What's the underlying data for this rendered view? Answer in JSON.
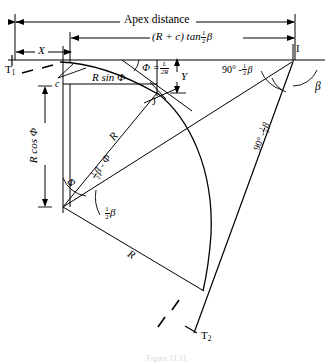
{
  "figure": {
    "caption": "Figure 11.11",
    "line_color": "#000000",
    "background": "#ffffff"
  },
  "dimensions": {
    "apex_distance": "Apex distance",
    "r_plus_c_tan": "(R + c) tan",
    "half_beta": "½ β",
    "x": "X",
    "y": "Y",
    "c": "c",
    "r_sin_phi": "R sin Φ",
    "r_cos_phi": "R cos Φ"
  },
  "points": {
    "t1": "T",
    "t1_sub": "1",
    "t2": "T",
    "t2_sub": "2",
    "i": "I",
    "j": "J"
  },
  "angles": {
    "phi_eq": "Φ =",
    "phi_num": "L",
    "phi_den": "2R",
    "ninety_minus_half_beta": "90° -",
    "ninety_minus_half_beta_right": "90° -",
    "beta": "β",
    "half_beta_angle": "β",
    "half_beta_minus_phi": "β - Φ",
    "phi": "Φ"
  },
  "radii": {
    "r_upper": "R",
    "r_lower": "R"
  },
  "fractions": {
    "one": "1",
    "two": "2",
    "L": "L",
    "twoR": "2R"
  }
}
